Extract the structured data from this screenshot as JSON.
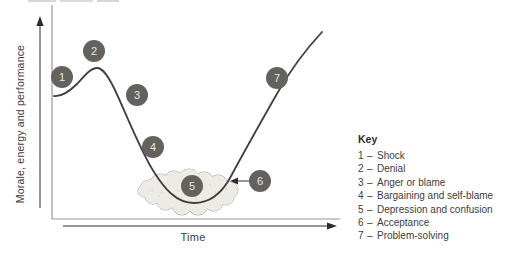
{
  "diagram": {
    "y_axis_label": "Morale, energy and performance",
    "x_axis_label": "Time",
    "key": {
      "title": "Key",
      "separator": "–"
    },
    "stages": [
      {
        "number": "1",
        "label": "Shock"
      },
      {
        "number": "2",
        "label": "Denial"
      },
      {
        "number": "3",
        "label": "Anger or blame"
      },
      {
        "number": "4",
        "label": "Bargaining and self-blame"
      },
      {
        "number": "5",
        "label": "Depression and confusion"
      },
      {
        "number": "6",
        "label": "Acceptance"
      },
      {
        "number": "7",
        "label": "Problem-solving"
      }
    ],
    "colors": {
      "curve": "#403f3d",
      "axis_frame": "#979691",
      "arrow": "#2e2d2b",
      "stage_circle": "#63625f",
      "stage_number": "#eae7e0",
      "cloud_fill": "#edebe5",
      "cloud_stroke": "#9e9d98",
      "text": "#3e3d3b"
    }
  }
}
